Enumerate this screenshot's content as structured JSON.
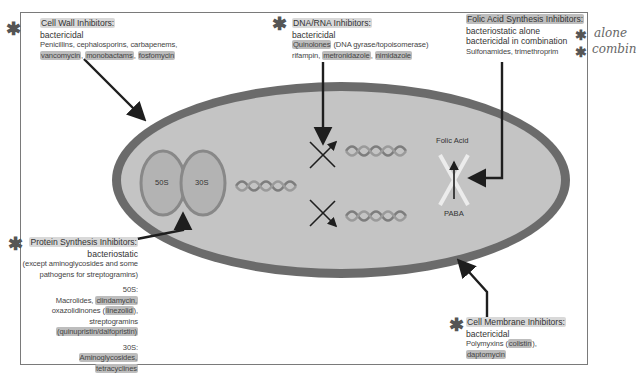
{
  "diagram": {
    "colors": {
      "cell_wall": "#6b6b6b",
      "cytoplasm": "#c4c4c4",
      "ribosome_fill": "#b3b3b3",
      "ribosome_outline": "#888888",
      "arrow": "#1e1e1e",
      "highlight": "#d9d9d9"
    },
    "cell": {
      "ribosome": {
        "large_subunit": "50S",
        "small_subunit": "30S"
      },
      "folic_acid_label": "Folic Acid",
      "paba_label": "PABA"
    },
    "boxes": {
      "cell_wall": {
        "title": "Cell Wall Inhibitors:",
        "kind": "bactericidal",
        "drugs_line1": "Penicillins, cephalosporins, carbapenems,",
        "drugs_hl": [
          "vancomycin",
          "monobactams",
          "fosfomycin"
        ]
      },
      "dna_rna": {
        "title": "DNA/RNA Inhibitors:",
        "kind": "bactericidal",
        "quinolones": "Quinolones",
        "quinolones_note": "(DNA gyrase/topoisomerase)",
        "rifampin": "rifampin,",
        "drugs_hl": [
          "metronidazole",
          "nimidazole"
        ]
      },
      "folic_acid": {
        "title": "Folic Acid Synthesis Inhibitors:",
        "kind_line1": "bacteriostatic alone",
        "kind_line2": "bactericidal in combination",
        "drugs": "Sulfonamides, trimethroprim"
      },
      "protein_synthesis": {
        "title": "Protein Synthesis Inhibitors:",
        "kind": "bacteriostatic",
        "note_line1": "(except aminoglycosides and some",
        "note_line2": "pathogens for streptogramins)",
        "s50_label": "50S:",
        "s50_macrolides": "Macrolides,",
        "s50_clindamycin": "clindamycin,",
        "s50_oxazolidinones": "oxazolidinones (",
        "s50_linezolid": "linezolid",
        "s50_close": "),",
        "s50_streptogramins": "streptogramins",
        "s50_quinupristin": "(quinupristin/dalfopristin)",
        "s30_label": "30S:",
        "s30_aminoglycosides": "Aminoglycosides,",
        "s30_tetracyclines": "tetracyclines"
      },
      "cell_membrane": {
        "title": "Cell Membrane Inhibitors:",
        "kind": "bactericidal",
        "polymyxins": "Polymyxins (",
        "colistin": "colistin",
        "close": "),",
        "daptomycin": "daptomycin"
      }
    },
    "annotations": {
      "asterisk": "✱",
      "handwritten_alone": "alone",
      "handwritten_combo": "combin"
    }
  }
}
